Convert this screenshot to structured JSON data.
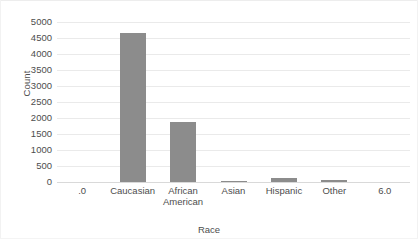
{
  "chart_data": {
    "type": "bar",
    "title": "",
    "xlabel": "Race",
    "ylabel": "Count",
    "categories": [
      ".0",
      "Caucasian",
      "African American",
      "Asian",
      "Hispanic",
      "Other",
      "6.0"
    ],
    "values": [
      null,
      4670,
      1880,
      40,
      130,
      60,
      null
    ],
    "ylim": [
      0,
      5000
    ],
    "yticks": [
      0,
      500,
      1000,
      1500,
      2000,
      2500,
      3000,
      3500,
      4000,
      4500,
      5000
    ],
    "ytick_labels": [
      "0",
      "500",
      "1000",
      "1500",
      "2000",
      "2500",
      "3000",
      "3500",
      "4000",
      "4500",
      "5000"
    ],
    "grid": true,
    "legend": false,
    "bar_color": "#8c8c8c",
    "gridline_color": "#eaeaea",
    "background_color": "#ffffff",
    "text_color": "#4d4d4d"
  },
  "axes": {
    "y_title": "Count",
    "x_title": "Race"
  },
  "y_ticks": [
    {
      "label": "5000",
      "value": 5000
    },
    {
      "label": "4500",
      "value": 4500
    },
    {
      "label": "4000",
      "value": 4000
    },
    {
      "label": "3500",
      "value": 3500
    },
    {
      "label": "3000",
      "value": 3000
    },
    {
      "label": "2500",
      "value": 2500
    },
    {
      "label": "2000",
      "value": 2000
    },
    {
      "label": "1500",
      "value": 1500
    },
    {
      "label": "1000",
      "value": 1000
    },
    {
      "label": "500",
      "value": 500
    },
    {
      "label": "0",
      "value": 0
    }
  ],
  "x_ticks": [
    {
      "label": ".0"
    },
    {
      "label": "Caucasian"
    },
    {
      "label": "African\nAmerican"
    },
    {
      "label": "Asian"
    },
    {
      "label": "Hispanic"
    },
    {
      "label": "Other"
    },
    {
      "label": "6.0"
    }
  ],
  "bars": [
    {
      "category": "Caucasian",
      "value": 4670
    },
    {
      "category": "African American",
      "value": 1880
    },
    {
      "category": "Asian",
      "value": 40
    },
    {
      "category": "Hispanic",
      "value": 130
    },
    {
      "category": "Other",
      "value": 60
    }
  ]
}
